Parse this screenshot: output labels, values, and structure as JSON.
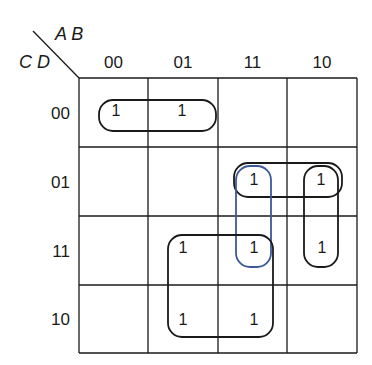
{
  "variables": {
    "columns": "A B",
    "rows": "C D"
  },
  "column_labels": [
    "00",
    "01",
    "11",
    "10"
  ],
  "row_labels": [
    "00",
    "01",
    "11",
    "10"
  ],
  "cells": [
    [
      "1",
      "1",
      "",
      ""
    ],
    [
      "",
      "",
      "1",
      "1"
    ],
    [
      "",
      "1",
      "1",
      "1"
    ],
    [
      "",
      "1",
      "1",
      ""
    ]
  ],
  "groups": [
    {
      "name": "row00-pair",
      "rows": [
        0,
        0
      ],
      "cols": [
        0,
        1
      ],
      "color": "#1a1a1a"
    },
    {
      "name": "row01-pair",
      "rows": [
        1,
        1
      ],
      "cols": [
        2,
        3
      ],
      "color": "#1a1a1a"
    },
    {
      "name": "col11-pair",
      "rows": [
        1,
        2
      ],
      "cols": [
        2,
        2
      ],
      "color": "#3a5a9a"
    },
    {
      "name": "col10-pair",
      "rows": [
        1,
        2
      ],
      "cols": [
        3,
        3
      ],
      "color": "#1a1a1a"
    },
    {
      "name": "quad",
      "rows": [
        2,
        3
      ],
      "cols": [
        1,
        2
      ],
      "color": "#1a1a1a"
    }
  ],
  "colors": {
    "grid": "#1a1a1a",
    "blue_group": "#3a5a9a"
  }
}
